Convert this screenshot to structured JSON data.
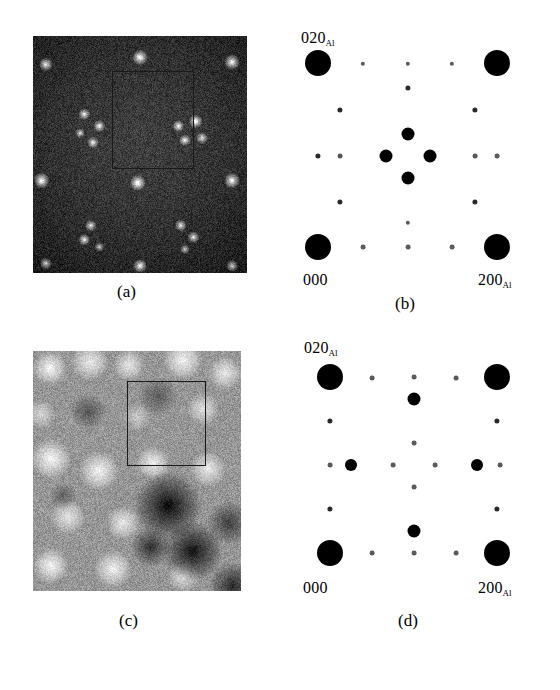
{
  "figure": {
    "background": "#ffffff",
    "panels": [
      {
        "id": "a",
        "caption": "(a)",
        "type": "micrograph",
        "style": "dark-field HRTEM, dark background with bright spots",
        "rect": {
          "x": 33,
          "y": 36,
          "width": 214,
          "height": 237
        },
        "caption_pos": {
          "x": 117,
          "y": 283
        },
        "selection_box": {
          "x": 79,
          "y": 35,
          "width": 82,
          "height": 98
        },
        "bright_spots": [
          {
            "x": 6,
            "y": 12,
            "r": 7,
            "i": 0.85
          },
          {
            "x": 50,
            "y": 9,
            "r": 8,
            "i": 0.95
          },
          {
            "x": 93,
            "y": 11,
            "r": 8,
            "i": 0.9
          },
          {
            "x": 24,
            "y": 33,
            "r": 6,
            "i": 0.8
          },
          {
            "x": 31,
            "y": 38,
            "r": 6,
            "i": 0.85
          },
          {
            "x": 22,
            "y": 41,
            "r": 5,
            "i": 0.7
          },
          {
            "x": 28,
            "y": 45,
            "r": 6,
            "i": 0.8
          },
          {
            "x": 68,
            "y": 38,
            "r": 6,
            "i": 0.85
          },
          {
            "x": 76,
            "y": 36,
            "r": 7,
            "i": 0.9
          },
          {
            "x": 71,
            "y": 44,
            "r": 6,
            "i": 0.8
          },
          {
            "x": 79,
            "y": 43,
            "r": 6,
            "i": 0.75
          },
          {
            "x": 4,
            "y": 61,
            "r": 8,
            "i": 0.95
          },
          {
            "x": 49,
            "y": 62,
            "r": 8,
            "i": 0.95
          },
          {
            "x": 93,
            "y": 61,
            "r": 8,
            "i": 0.9
          },
          {
            "x": 27,
            "y": 80,
            "r": 6,
            "i": 0.8
          },
          {
            "x": 24,
            "y": 86,
            "r": 6,
            "i": 0.85
          },
          {
            "x": 31,
            "y": 89,
            "r": 5,
            "i": 0.7
          },
          {
            "x": 69,
            "y": 80,
            "r": 6,
            "i": 0.8
          },
          {
            "x": 75,
            "y": 85,
            "r": 6,
            "i": 0.8
          },
          {
            "x": 71,
            "y": 90,
            "r": 5,
            "i": 0.7
          },
          {
            "x": 50,
            "y": 97,
            "r": 7,
            "i": 0.9
          },
          {
            "x": 6,
            "y": 96,
            "r": 6,
            "i": 0.75
          },
          {
            "x": 93,
            "y": 97,
            "r": 6,
            "i": 0.75
          }
        ]
      },
      {
        "id": "b",
        "caption": "(b)",
        "type": "diffraction",
        "rect": {
          "x": 288,
          "y": 38,
          "width": 232,
          "height": 232
        },
        "caption_pos": {
          "x": 395,
          "y": 295
        },
        "labels": [
          {
            "text": "020",
            "sub": "Al",
            "x": 301,
            "y": 30,
            "anchor": "left"
          },
          {
            "text": "000",
            "sub": "",
            "x": 303,
            "y": 272,
            "anchor": "left"
          },
          {
            "text": "200",
            "sub": "Al",
            "x": 478,
            "y": 272,
            "anchor": "left"
          }
        ],
        "lattice": {
          "origin": {
            "x": 318,
            "y": 247
          },
          "a_vector": {
            "dx": 179,
            "dy": 0
          },
          "b_vector": {
            "dx": 0,
            "dy": -184
          }
        },
        "spots": [
          {
            "x": 318,
            "y": 63,
            "r": 13,
            "k": "strong"
          },
          {
            "x": 497,
            "y": 63,
            "r": 13,
            "k": "strong"
          },
          {
            "x": 318,
            "y": 247,
            "r": 13,
            "k": "strong"
          },
          {
            "x": 497,
            "y": 247,
            "r": 13,
            "k": "strong"
          },
          {
            "x": 408,
            "y": 134,
            "r": 6.5,
            "k": "medium"
          },
          {
            "x": 408,
            "y": 178,
            "r": 6.5,
            "k": "medium"
          },
          {
            "x": 386,
            "y": 156,
            "r": 6.5,
            "k": "medium"
          },
          {
            "x": 430,
            "y": 156,
            "r": 6.5,
            "k": "medium"
          },
          {
            "x": 363,
            "y": 64,
            "r": 2.2,
            "k": "weak"
          },
          {
            "x": 408,
            "y": 64,
            "r": 2.2,
            "k": "weak"
          },
          {
            "x": 452,
            "y": 64,
            "r": 2.2,
            "k": "weak"
          },
          {
            "x": 408,
            "y": 88,
            "r": 2.6,
            "k": "weak"
          },
          {
            "x": 340,
            "y": 110,
            "r": 2.6,
            "k": "weak"
          },
          {
            "x": 475,
            "y": 110,
            "r": 2.6,
            "k": "weak"
          },
          {
            "x": 318,
            "y": 156,
            "r": 2.6,
            "k": "weak"
          },
          {
            "x": 340,
            "y": 156,
            "r": 2.4,
            "k": "weak"
          },
          {
            "x": 475,
            "y": 156,
            "r": 2.4,
            "k": "weak"
          },
          {
            "x": 497,
            "y": 156,
            "r": 2.4,
            "k": "weak"
          },
          {
            "x": 340,
            "y": 202,
            "r": 2.6,
            "k": "weak"
          },
          {
            "x": 475,
            "y": 202,
            "r": 2.6,
            "k": "weak"
          },
          {
            "x": 408,
            "y": 223,
            "r": 2.2,
            "k": "weak"
          },
          {
            "x": 363,
            "y": 247,
            "r": 2.4,
            "k": "weak"
          },
          {
            "x": 408,
            "y": 247,
            "r": 2.4,
            "k": "weak"
          },
          {
            "x": 452,
            "y": 247,
            "r": 2.4,
            "k": "weak"
          }
        ]
      },
      {
        "id": "c",
        "caption": "(c)",
        "type": "micrograph",
        "style": "bright-field HRTEM, light mottled contrast",
        "rect": {
          "x": 33,
          "y": 351,
          "width": 208,
          "height": 240
        },
        "caption_pos": {
          "x": 119,
          "y": 612
        },
        "selection_box": {
          "x": 94,
          "y": 30,
          "width": 79,
          "height": 85
        },
        "blobs": [
          {
            "x": 17,
            "y": 17,
            "r": 17,
            "i": 0.95
          },
          {
            "x": 57,
            "y": 11,
            "r": 19,
            "i": 0.82
          },
          {
            "x": 96,
            "y": 14,
            "r": 16,
            "i": 0.78
          },
          {
            "x": 150,
            "y": 9,
            "r": 20,
            "i": 0.9
          },
          {
            "x": 192,
            "y": 22,
            "r": 17,
            "i": 0.8
          },
          {
            "x": 8,
            "y": 63,
            "r": 15,
            "i": 0.6
          },
          {
            "x": 104,
            "y": 66,
            "r": 14,
            "i": 0.5
          },
          {
            "x": 170,
            "y": 58,
            "r": 16,
            "i": 0.72
          },
          {
            "x": 18,
            "y": 108,
            "r": 20,
            "i": 0.95
          },
          {
            "x": 66,
            "y": 120,
            "r": 20,
            "i": 0.9
          },
          {
            "x": 120,
            "y": 112,
            "r": 17,
            "i": 0.85
          },
          {
            "x": 175,
            "y": 118,
            "r": 18,
            "i": 0.8
          },
          {
            "x": 35,
            "y": 166,
            "r": 18,
            "i": 0.75
          },
          {
            "x": 90,
            "y": 172,
            "r": 17,
            "i": 0.8
          },
          {
            "x": 18,
            "y": 215,
            "r": 18,
            "i": 0.92
          },
          {
            "x": 80,
            "y": 218,
            "r": 19,
            "i": 0.88
          },
          {
            "x": 150,
            "y": 225,
            "r": 16,
            "i": 0.7
          }
        ],
        "dark_blobs": [
          {
            "x": 135,
            "y": 155,
            "r": 34,
            "i": 0.95
          },
          {
            "x": 160,
            "y": 200,
            "r": 30,
            "i": 0.9
          },
          {
            "x": 118,
            "y": 196,
            "r": 20,
            "i": 0.7
          },
          {
            "x": 196,
            "y": 172,
            "r": 22,
            "i": 0.6
          },
          {
            "x": 55,
            "y": 60,
            "r": 18,
            "i": 0.45
          },
          {
            "x": 125,
            "y": 45,
            "r": 20,
            "i": 0.4
          },
          {
            "x": 30,
            "y": 145,
            "r": 14,
            "i": 0.35
          },
          {
            "x": 200,
            "y": 235,
            "r": 24,
            "i": 0.75
          }
        ]
      },
      {
        "id": "d",
        "caption": "(d)",
        "type": "diffraction",
        "rect": {
          "x": 288,
          "y": 345,
          "width": 232,
          "height": 232
        },
        "caption_pos": {
          "x": 398,
          "y": 612
        },
        "labels": [
          {
            "text": "020",
            "sub": "Al",
            "x": 304,
            "y": 340,
            "anchor": "left"
          },
          {
            "text": "000",
            "sub": "",
            "x": 303,
            "y": 580,
            "anchor": "left"
          },
          {
            "text": "200",
            "sub": "Al",
            "x": 478,
            "y": 580,
            "anchor": "left"
          }
        ],
        "lattice": {
          "origin": {
            "x": 330,
            "y": 553
          },
          "a_vector": {
            "dx": 167,
            "dy": 0
          },
          "b_vector": {
            "dx": 0,
            "dy": -176
          }
        },
        "spots": [
          {
            "x": 330,
            "y": 377,
            "r": 13,
            "k": "strong"
          },
          {
            "x": 497,
            "y": 377,
            "r": 13,
            "k": "strong"
          },
          {
            "x": 330,
            "y": 553,
            "r": 13,
            "k": "strong"
          },
          {
            "x": 497,
            "y": 553,
            "r": 13,
            "k": "strong"
          },
          {
            "x": 414,
            "y": 399,
            "r": 6.5,
            "k": "medium"
          },
          {
            "x": 414,
            "y": 531,
            "r": 6.5,
            "k": "medium"
          },
          {
            "x": 351,
            "y": 465,
            "r": 6.0,
            "k": "medium"
          },
          {
            "x": 477,
            "y": 465,
            "r": 6.0,
            "k": "medium"
          },
          {
            "x": 372,
            "y": 378,
            "r": 2.4,
            "k": "weak"
          },
          {
            "x": 414,
            "y": 377,
            "r": 2.4,
            "k": "weak"
          },
          {
            "x": 456,
            "y": 378,
            "r": 2.4,
            "k": "weak"
          },
          {
            "x": 330,
            "y": 421,
            "r": 2.6,
            "k": "weak"
          },
          {
            "x": 497,
            "y": 421,
            "r": 2.6,
            "k": "weak"
          },
          {
            "x": 414,
            "y": 443,
            "r": 2.4,
            "k": "weak"
          },
          {
            "x": 330,
            "y": 465,
            "r": 2.4,
            "k": "weak"
          },
          {
            "x": 393,
            "y": 465,
            "r": 2.4,
            "k": "weak"
          },
          {
            "x": 435,
            "y": 465,
            "r": 2.4,
            "k": "weak"
          },
          {
            "x": 500,
            "y": 465,
            "r": 2.4,
            "k": "weak"
          },
          {
            "x": 414,
            "y": 487,
            "r": 2.4,
            "k": "weak"
          },
          {
            "x": 330,
            "y": 509,
            "r": 2.6,
            "k": "weak"
          },
          {
            "x": 497,
            "y": 509,
            "r": 2.6,
            "k": "weak"
          },
          {
            "x": 372,
            "y": 553,
            "r": 2.4,
            "k": "weak"
          },
          {
            "x": 414,
            "y": 553,
            "r": 2.4,
            "k": "weak"
          },
          {
            "x": 456,
            "y": 553,
            "r": 2.4,
            "k": "weak"
          }
        ]
      }
    ]
  }
}
